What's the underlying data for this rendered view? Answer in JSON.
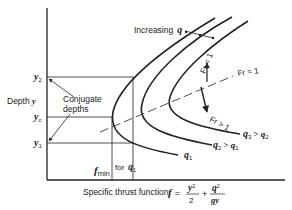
{
  "diagram": {
    "type": "specific-thrust-curves",
    "colors": {
      "line": "#222222",
      "background": "#ffffff"
    },
    "axes": {
      "y_label": "Depth",
      "y_symbol": "y",
      "x_label": "Specific thrust function,",
      "x_formula": {
        "lhs": "f",
        "equals": "=",
        "term1_num": "y",
        "term1_num_exp": "2",
        "term1_den": "2",
        "plus": "+",
        "term2_num": "q",
        "term2_num_exp": "2",
        "term2_den": "gy"
      }
    },
    "depth_marks": [
      {
        "symbol": "y",
        "sub": "2"
      },
      {
        "symbol": "y",
        "sub": "c"
      },
      {
        "symbol": "y",
        "sub": "1"
      }
    ],
    "annotations": {
      "conjugate_line1": "Conjugate",
      "conjugate_line2": "depths",
      "increasing": "Increasing",
      "increasing_symbol": "q",
      "fmin_symbol": "f",
      "fmin_sub": "min",
      "for_text": "for",
      "for_symbol": "q",
      "for_sub": "1",
      "fr_eq": "Fr = 1",
      "fr_lt": "Fr < 1",
      "fr_gt": "Fr > 1"
    },
    "curves": [
      {
        "label_symbol": "q",
        "label_sub": "1",
        "relation": ""
      },
      {
        "label_symbol": "q",
        "label_sub": "2",
        "relation": "> q",
        "relation_sub": "1"
      },
      {
        "label_symbol": "q",
        "label_sub": "3",
        "relation": "> q",
        "relation_sub": "2"
      }
    ]
  }
}
